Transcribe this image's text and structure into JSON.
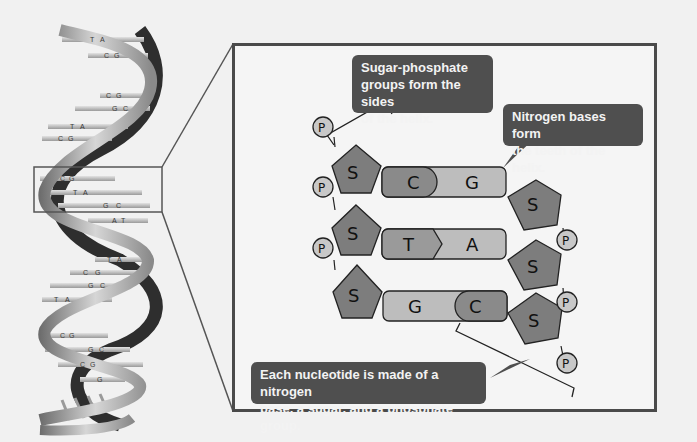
{
  "diagram": {
    "colors": {
      "background": "#f1f1f1",
      "box_border": "#4a4a4a",
      "callout_fill": "#4f4f4f",
      "callout_text": "#f3f3f3",
      "sugar_fill": "#7d7d7d",
      "phosphate_fill": "#c8c8c8",
      "base_dark": "#8a8a8a",
      "base_light": "#bdbdbd"
    },
    "helix": {
      "pairs": [
        {
          "left": "T",
          "right": "A"
        },
        {
          "left": "C",
          "right": "G"
        },
        {
          "left": "C",
          "right": "G"
        },
        {
          "left": "G",
          "right": "C"
        },
        {
          "left": "T",
          "right": "A"
        },
        {
          "left": "C",
          "right": "G"
        },
        {
          "left": "C",
          "right": "G"
        },
        {
          "left": "T",
          "right": "A"
        },
        {
          "left": "G",
          "right": "C"
        },
        {
          "left": "A",
          "right": "T"
        },
        {
          "left": "T",
          "right": "A"
        },
        {
          "left": "C",
          "right": "G"
        },
        {
          "left": "G",
          "right": "C"
        },
        {
          "left": "T",
          "right": "A"
        },
        {
          "left": "C",
          "right": "G"
        },
        {
          "left": "G",
          "right": "C"
        },
        {
          "left": "C",
          "right": "G"
        },
        {
          "left": "G",
          "right": ""
        }
      ]
    },
    "callouts": {
      "sugar_phosphate": "Sugar-phosphate groups form the sides of the helix.",
      "sugar_phosphate_lines": [
        "Sugar-phosphate",
        "groups form the sides",
        "of the helix."
      ],
      "nitrogen_bases": "Nitrogen bases form the teeth of the helix.",
      "nitrogen_bases_lines": [
        "Nitrogen bases form",
        "the teeth of the helix."
      ],
      "nucleotide": "Each nucleotide is made of a nitrogen base, a sugar, and a phosphate group.",
      "nucleotide_lines": [
        "Each nucleotide is made of a nitrogen",
        "base, a sugar, and a phosphate group."
      ]
    },
    "detail": {
      "left_strand": {
        "phosphate_label": "P",
        "sugar_label": "S"
      },
      "right_strand": {
        "phosphate_label": "P",
        "sugar_label": "S"
      },
      "base_pairs": [
        {
          "left": "C",
          "right": "G"
        },
        {
          "left": "T",
          "right": "A"
        },
        {
          "left": "G",
          "right": "C"
        }
      ]
    }
  }
}
